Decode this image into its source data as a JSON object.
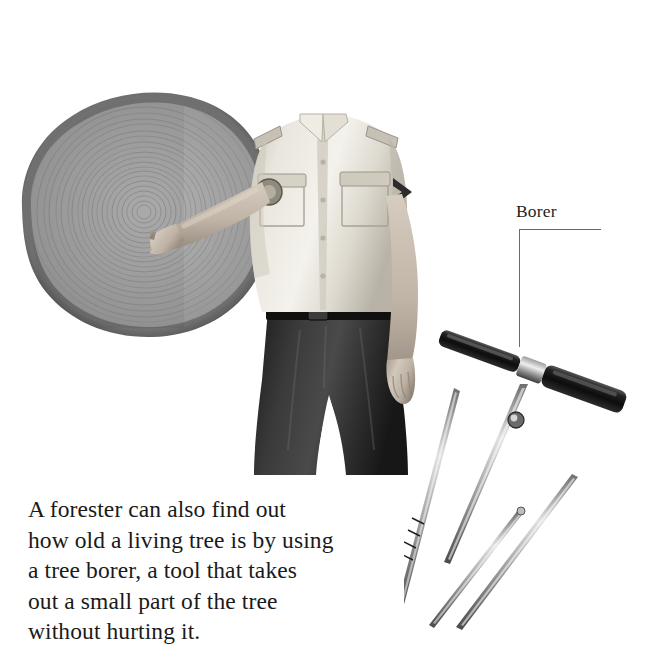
{
  "page": {
    "width": 672,
    "height": 667,
    "background": "#ffffff",
    "kind": "textbook-illustration"
  },
  "caption": {
    "lines": [
      "A forester can also find out",
      "how old a living tree is by using",
      "a tree borer, a tool that takes",
      "out a small part of the tree",
      "without hurting it."
    ],
    "full_text": "A forester can also find out how old a living tree is by using a tree borer, a tool that takes out a small part of the tree without hurting it.",
    "color": "#1a1a1a"
  },
  "callout": {
    "label": "Borer",
    "label_color": "#1f1f1f",
    "line_color": "#6a6a6a",
    "points_to": "borer-tool-handle"
  },
  "illustration": {
    "tree_cross_section": {
      "name": "tree-cross-section",
      "description": "Cut log disc showing concentric annual growth rings",
      "bark_color": "#4a4a4a",
      "wood_color": "#a3a3a3",
      "ring_color": "#8a8a8a",
      "ring_count": 22
    },
    "forester": {
      "name": "forester-figure",
      "description": "Man in uniform cap and short-sleeve shirt pointing at the tree rings",
      "cap_color": "#3c3c3c",
      "shirt_color": "#e8e5dd",
      "trousers_color": "#2b2b2b",
      "belt_color": "#141414",
      "skin_color": "#cfc4b6"
    },
    "borer_tool": {
      "name": "increment-borer-tool",
      "description": "T-handle increment borer with bit and extractor rods",
      "handle_color": "#141414",
      "metal_color": "#9a9a9a",
      "parts": [
        "t-handle",
        "borer-bit",
        "extractor-rod-long",
        "extractor-rod-medium",
        "extractor-rod-short"
      ]
    }
  }
}
